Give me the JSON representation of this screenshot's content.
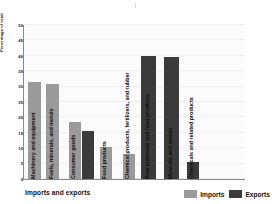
{
  "chart_data": {
    "type": "bar",
    "title": "",
    "xlabel": "Imports and exports",
    "ylabel": "Percentage of total",
    "ylim": [
      0,
      50
    ],
    "yticks": [
      0,
      5,
      10,
      15,
      20,
      25,
      30,
      35,
      40,
      45,
      50
    ],
    "grid": true,
    "legend_position": "bottom-right",
    "categories": [
      "Machinery and equipment",
      "Fuels, minerals, and metals",
      "Consumer goods",
      "",
      "Food products",
      "Chemical products, fertilizers, and rubber",
      "Raw materials and food products",
      "Minerals and metals",
      "Chemicals and related products"
    ],
    "bars": [
      {
        "label": "Machinery and equipment",
        "value": 31.5,
        "series": "Imports"
      },
      {
        "label": "Fuels, minerals, and metals",
        "value": 31.0,
        "series": "Imports"
      },
      {
        "label": "Consumer goods",
        "value": 18.5,
        "series": "Imports"
      },
      {
        "label": "",
        "value": 15.5,
        "series": "Exports"
      },
      {
        "label": "Food products",
        "value": 10.5,
        "series": "Imports"
      },
      {
        "label": "Chemical products, fertilizers, and rubber",
        "value": 8.0,
        "series": "Imports"
      },
      {
        "label": "Raw materials and food products",
        "value": 40.0,
        "series": "Exports"
      },
      {
        "label": "Minerals and metals",
        "value": 39.5,
        "series": "Exports"
      },
      {
        "label": "Chemicals and related products",
        "value": 5.5,
        "series": "Exports"
      }
    ],
    "series": [
      {
        "name": "Imports",
        "color": "#9a9a9a"
      },
      {
        "name": "Exports",
        "color": "#3b3b3b"
      }
    ]
  },
  "legend": {
    "imports_label": "Imports",
    "exports_label": "Exports"
  },
  "axis": {
    "x_title": "Imports and exports",
    "y_title": "Percentage of total"
  }
}
